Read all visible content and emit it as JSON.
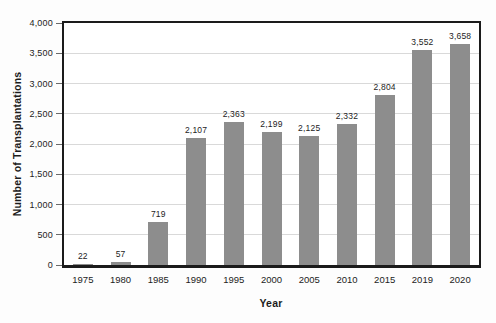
{
  "chart_data": {
    "type": "bar",
    "title": "",
    "xlabel": "Year",
    "ylabel": "Number of Transplantations",
    "categories": [
      "1975",
      "1980",
      "1985",
      "1990",
      "1995",
      "2000",
      "2005",
      "2010",
      "2015",
      "2019",
      "2020"
    ],
    "values": [
      22,
      57,
      719,
      2107,
      2363,
      2199,
      2125,
      2332,
      2804,
      3552,
      3658
    ],
    "value_labels": [
      "22",
      "57",
      "719",
      "2,107",
      "2,363",
      "2,199",
      "2,125",
      "2,332",
      "2,804",
      "3,552",
      "3,658"
    ],
    "ylim": [
      0,
      4000
    ],
    "ytick_values": [
      0,
      500,
      1000,
      1500,
      2000,
      2500,
      3000,
      3500,
      4000
    ],
    "ytick_labels": [
      "0",
      "500",
      "1,000",
      "1,500",
      "2,000",
      "2,500",
      "3,000",
      "3,500",
      "4,000"
    ],
    "gridline_values": [
      500,
      1000,
      1500,
      2000,
      2500,
      3000,
      3500
    ],
    "grid": "horizontal",
    "legend": "none",
    "bar_width_px": 20,
    "colors": {
      "bar": "#8d8d8d",
      "gridline": "#d9d9d9",
      "frame": "#1b1b1b",
      "text": "#1c1c1c"
    }
  }
}
